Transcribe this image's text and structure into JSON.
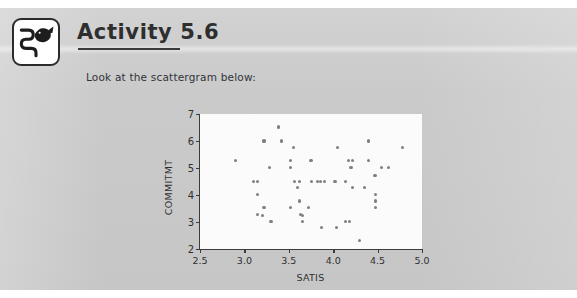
{
  "header": {
    "title": "Activity 5.6",
    "icon_name": "fish-over-stream-icon"
  },
  "body": {
    "instruction": "Look at the scattergram below:"
  },
  "chart_data": {
    "type": "scatter",
    "title": "",
    "xlabel": "SATIS",
    "ylabel": "COMMITMT",
    "xlim": [
      2.5,
      5.0
    ],
    "ylim": [
      2,
      7
    ],
    "xticks": [
      "2.5",
      "3.0",
      "3.5",
      "4.0",
      "4.5",
      "5.0"
    ],
    "xtick_values": [
      2.5,
      3.0,
      3.5,
      4.0,
      4.5,
      5.0
    ],
    "yticks": [
      "2",
      "3",
      "4",
      "5",
      "6",
      "7"
    ],
    "ytick_values": [
      2,
      3,
      4,
      5,
      6,
      7
    ],
    "grid": false,
    "legend": null,
    "marker_color": "#7e7e86",
    "plot_background": "#fbfbfb",
    "points": [
      [
        2.9,
        5.28
      ],
      [
        3.1,
        4.5
      ],
      [
        3.15,
        4.5
      ],
      [
        3.15,
        4.02
      ],
      [
        3.15,
        3.28
      ],
      [
        3.2,
        3.25
      ],
      [
        3.22,
        6.0
      ],
      [
        3.22,
        3.55
      ],
      [
        3.28,
        5.02
      ],
      [
        3.3,
        3.02
      ],
      [
        3.38,
        6.52
      ],
      [
        3.42,
        6.0
      ],
      [
        3.52,
        5.28
      ],
      [
        3.52,
        5.02
      ],
      [
        3.52,
        3.53
      ],
      [
        3.55,
        5.77
      ],
      [
        3.56,
        4.5
      ],
      [
        3.62,
        4.5
      ],
      [
        3.6,
        4.28
      ],
      [
        3.62,
        3.78
      ],
      [
        3.63,
        3.28
      ],
      [
        3.65,
        3.25
      ],
      [
        3.65,
        3.02
      ],
      [
        3.72,
        3.53
      ],
      [
        3.75,
        5.28
      ],
      [
        3.76,
        4.5
      ],
      [
        3.82,
        4.5
      ],
      [
        3.86,
        4.5
      ],
      [
        3.9,
        4.5
      ],
      [
        3.87,
        2.8
      ],
      [
        4.02,
        4.5
      ],
      [
        4.05,
        5.77
      ],
      [
        4.04,
        2.8
      ],
      [
        4.14,
        4.5
      ],
      [
        4.14,
        3.02
      ],
      [
        4.18,
        3.02
      ],
      [
        4.17,
        5.28
      ],
      [
        4.22,
        5.28
      ],
      [
        4.2,
        5.02
      ],
      [
        4.22,
        4.28
      ],
      [
        4.3,
        2.3
      ],
      [
        4.35,
        4.28
      ],
      [
        4.4,
        6.0
      ],
      [
        4.4,
        5.28
      ],
      [
        4.47,
        4.73
      ],
      [
        4.48,
        4.02
      ],
      [
        4.48,
        3.78
      ],
      [
        4.48,
        3.53
      ],
      [
        4.54,
        5.02
      ],
      [
        4.62,
        5.02
      ],
      [
        4.78,
        5.77
      ]
    ]
  }
}
